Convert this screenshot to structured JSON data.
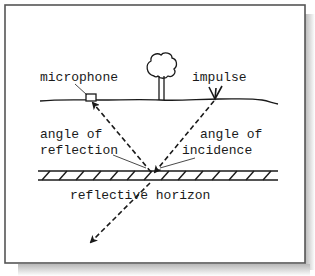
{
  "diagram": {
    "title": "",
    "labels": {
      "microphone": "microphone",
      "impulse": "impulse",
      "angle_reflection_line1": "angle of",
      "angle_reflection_line2": "reflection",
      "angle_incidence_line1": "angle of",
      "angle_incidence_line2": "incidence",
      "horizon": "reflective horizon"
    },
    "elements": [
      {
        "id": "ground-surface",
        "kind": "line"
      },
      {
        "id": "tree",
        "kind": "icon"
      },
      {
        "id": "microphone",
        "kind": "icon"
      },
      {
        "id": "impulse-source",
        "kind": "icon"
      },
      {
        "id": "reflective-horizon",
        "kind": "hatched-bar"
      },
      {
        "id": "incident-ray",
        "kind": "dashed-arrow",
        "from": "impulse-source",
        "to": "reflection-point"
      },
      {
        "id": "reflected-ray",
        "kind": "dashed-arrow",
        "from": "reflection-point",
        "to": "microphone"
      },
      {
        "id": "transmitted-ray",
        "kind": "dashed-arrow",
        "from": "reflection-point",
        "to": "below-horizon"
      }
    ],
    "colors": {
      "ink": "#1a1a1a",
      "frame": "#555555",
      "background": "#ffffff",
      "shadow": "#c8c8c8"
    }
  }
}
